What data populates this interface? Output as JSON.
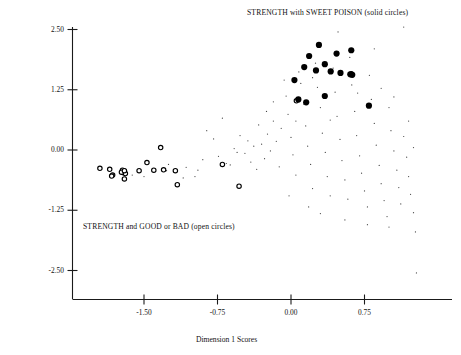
{
  "figure": {
    "title": "",
    "annotations": {
      "solid_series_note": "STRENGTH with SWEET POISON (solid circles)",
      "open_series_note": "STRENGTH and GOOD or BAD (open circles)"
    },
    "axis_labels": {
      "x": "Dimension 1 Scores",
      "y": "Dimension 2 Scores"
    }
  },
  "chart_data": {
    "type": "scatter",
    "title": "",
    "xlabel": "Dimension 1 Scores",
    "ylabel": "Dimension 2 Scores",
    "xlim": [
      -2.05,
      1.35
    ],
    "ylim": [
      -2.75,
      2.7
    ],
    "grid": false,
    "legend_position": "in-plot annotations",
    "xticks": [
      -1.5,
      -0.75,
      0.0,
      0.75
    ],
    "xticklabels": [
      "-1.50",
      "-0.75",
      "0.00",
      "0.75"
    ],
    "yticks": [
      2.5,
      1.25,
      0.0,
      -1.25,
      -2.5
    ],
    "yticklabels": [
      "2.50",
      "1.25",
      "0.00",
      "-1.25",
      "-2.50"
    ],
    "annotations": [
      {
        "text": "STRENGTH with SWEET POISON (solid circles)",
        "x": 0.2,
        "y": 2.65
      },
      {
        "text": "STRENGTH and GOOD or BAD (open circles)",
        "x": -1.6,
        "y": -1.45
      }
    ],
    "series": [
      {
        "name": "STRENGTH with SWEET POISON (solid circles)",
        "marker": "solid-circle",
        "color": "#000000",
        "size": 5,
        "points": [
          [
            0.035,
            1.45
          ],
          [
            0.285,
            2.18
          ],
          [
            0.185,
            1.95
          ],
          [
            0.465,
            2.0
          ],
          [
            0.615,
            2.07
          ],
          [
            0.345,
            1.78
          ],
          [
            0.255,
            1.65
          ],
          [
            0.405,
            1.63
          ],
          [
            0.505,
            1.6
          ],
          [
            0.135,
            1.72
          ],
          [
            0.605,
            1.57
          ],
          [
            0.625,
            1.56
          ],
          [
            0.345,
            1.12
          ],
          [
            0.155,
            0.99
          ],
          [
            0.075,
            1.05
          ],
          [
            0.795,
            0.92
          ]
        ]
      },
      {
        "name": "STRENGTH and GOOD or BAD (open circles)",
        "marker": "open-circle",
        "color": "#000000",
        "size": 4,
        "points": [
          [
            -1.95,
            -0.38
          ],
          [
            -1.85,
            -0.4
          ],
          [
            -1.82,
            -0.52
          ],
          [
            -1.83,
            -0.54
          ],
          [
            -1.72,
            -0.42
          ],
          [
            -1.7,
            -0.44
          ],
          [
            -1.71,
            -0.47
          ],
          [
            -1.69,
            -0.49
          ],
          [
            -1.73,
            -0.46
          ],
          [
            -1.7,
            -0.6
          ],
          [
            -1.55,
            -0.43
          ],
          [
            -1.47,
            -0.26
          ],
          [
            -1.4,
            -0.42
          ],
          [
            -1.33,
            0.05
          ],
          [
            -1.3,
            -0.41
          ],
          [
            -1.18,
            -0.43
          ],
          [
            -1.16,
            -0.72
          ],
          [
            -0.7,
            -0.3
          ],
          [
            -0.53,
            -0.75
          ],
          [
            0.055,
            1.02
          ],
          [
            0.615,
            1.58
          ],
          [
            -1.7,
            -0.43
          ]
        ]
      },
      {
        "name": "background points (small dots)",
        "marker": "dot",
        "color": "#444444",
        "size": 1,
        "points": [
          [
            -1.27,
            -0.43
          ],
          [
            -1.07,
            -0.36
          ],
          [
            -0.98,
            -0.55
          ],
          [
            -0.9,
            -0.2
          ],
          [
            -0.86,
            0.4
          ],
          [
            -0.79,
            0.23
          ],
          [
            -0.74,
            -0.13
          ],
          [
            -0.7,
            0.66
          ],
          [
            -0.66,
            -0.28
          ],
          [
            -0.62,
            -0.31
          ],
          [
            -0.58,
            0.03
          ],
          [
            -0.55,
            -0.05
          ],
          [
            -0.52,
            0.3
          ],
          [
            -0.47,
            -0.07
          ],
          [
            -0.44,
            0.19
          ],
          [
            -0.41,
            -0.25
          ],
          [
            -0.38,
            0.08
          ],
          [
            -0.35,
            -0.4
          ],
          [
            -0.33,
            0.52
          ],
          [
            -0.3,
            0.12
          ],
          [
            -0.27,
            -0.18
          ],
          [
            -0.24,
            0.33
          ],
          [
            -0.21,
            -0.02
          ],
          [
            -0.18,
            0.6
          ],
          [
            -0.15,
            0.18
          ],
          [
            -0.12,
            -0.35
          ],
          [
            -0.1,
            0.45
          ],
          [
            -0.07,
            1.45
          ],
          [
            -0.05,
            1.12
          ],
          [
            -0.03,
            0.74
          ],
          [
            0.0,
            0.26
          ],
          [
            0.02,
            -0.1
          ],
          [
            0.05,
            -0.52
          ],
          [
            0.08,
            1.62
          ],
          [
            0.1,
            1.38
          ],
          [
            0.13,
            0.95
          ],
          [
            0.15,
            0.5
          ],
          [
            0.17,
            0.08
          ],
          [
            0.2,
            -0.3
          ],
          [
            0.22,
            -0.8
          ],
          [
            0.25,
            1.8
          ],
          [
            0.27,
            1.3
          ],
          [
            0.3,
            0.88
          ],
          [
            0.32,
            0.35
          ],
          [
            0.35,
            -0.05
          ],
          [
            0.37,
            -0.55
          ],
          [
            0.4,
            -0.95
          ],
          [
            0.43,
            1.7
          ],
          [
            0.45,
            1.2
          ],
          [
            0.47,
            0.7
          ],
          [
            0.5,
            0.22
          ],
          [
            0.52,
            -0.22
          ],
          [
            0.55,
            -0.62
          ],
          [
            0.58,
            -1.02
          ],
          [
            0.6,
            1.92
          ],
          [
            0.62,
            1.35
          ],
          [
            0.65,
            0.8
          ],
          [
            0.67,
            0.3
          ],
          [
            0.7,
            -0.12
          ],
          [
            0.72,
            -0.48
          ],
          [
            0.75,
            -0.85
          ],
          [
            0.78,
            -1.18
          ],
          [
            0.8,
            1.55
          ],
          [
            0.82,
            1.05
          ],
          [
            0.85,
            0.55
          ],
          [
            0.87,
            0.1
          ],
          [
            0.9,
            -0.32
          ],
          [
            0.92,
            -0.7
          ],
          [
            0.95,
            -1.05
          ],
          [
            0.98,
            -1.38
          ],
          [
            1.0,
            0.88
          ],
          [
            1.02,
            0.4
          ],
          [
            1.05,
            -0.02
          ],
          [
            1.08,
            -0.42
          ],
          [
            1.1,
            -0.78
          ],
          [
            1.12,
            -1.12
          ],
          [
            1.15,
            0.28
          ],
          [
            1.18,
            -0.15
          ],
          [
            1.2,
            -0.55
          ],
          [
            1.22,
            -0.92
          ],
          [
            1.25,
            -1.3
          ],
          [
            1.27,
            -1.7
          ],
          [
            1.28,
            -2.55
          ],
          [
            1.15,
            2.55
          ],
          [
            0.85,
            2.1
          ],
          [
            0.48,
            2.45
          ],
          [
            0.22,
            1.5
          ],
          [
            -0.18,
            1.0
          ],
          [
            0.92,
            1.28
          ],
          [
            1.05,
            1.1
          ],
          [
            0.68,
            1.18
          ],
          [
            0.4,
            0.62
          ],
          [
            0.05,
            0.6
          ],
          [
            -0.25,
            0.8
          ],
          [
            0.3,
            -1.32
          ],
          [
            0.55,
            -1.45
          ],
          [
            0.78,
            -1.55
          ],
          [
            1.0,
            -1.6
          ],
          [
            0.18,
            -1.18
          ],
          [
            -0.02,
            -0.95
          ],
          [
            1.2,
            0.6
          ],
          [
            1.25,
            0.05
          ],
          [
            -1.62,
            -0.52
          ],
          [
            -1.5,
            -0.55
          ],
          [
            -1.25,
            -0.3
          ],
          [
            -1.1,
            -0.58
          ],
          [
            -0.95,
            -0.42
          ]
        ]
      }
    ]
  }
}
